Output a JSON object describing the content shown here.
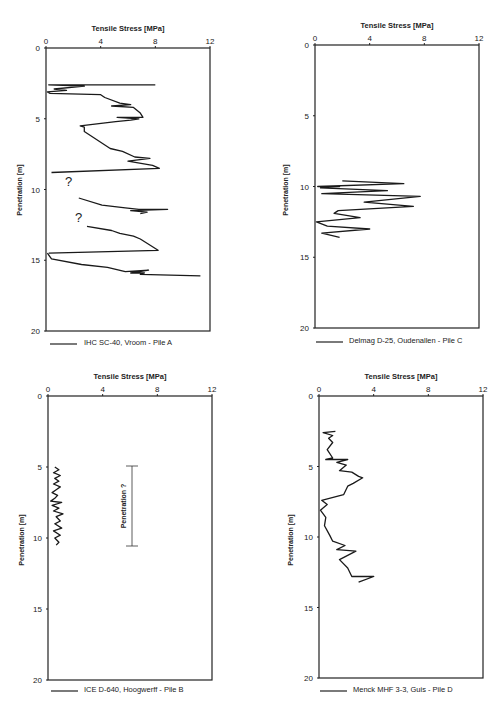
{
  "chart_data": [
    {
      "id": "A",
      "type": "line",
      "title": "",
      "xlabel": "Tensile Stress [MPa]",
      "ylabel": "Penetration [m]",
      "xlim": [
        0,
        12
      ],
      "ylim": [
        0,
        20
      ],
      "y_inverted": true,
      "x_ticks": [
        0,
        4,
        8,
        12
      ],
      "y_ticks": [
        0,
        5,
        10,
        15,
        20
      ],
      "legend": "IHC SC-40, Vroom - Pile A",
      "legend_position": "bottom-left",
      "grid": false,
      "annotations": [
        {
          "text": "?",
          "x": 2.4,
          "depth": 9.6
        },
        {
          "text": "?",
          "x": 2.5,
          "depth": 12.2
        }
      ],
      "series": [
        {
          "name": "Pile A segment 1",
          "points": [
            [
              8.0,
              2.6
            ],
            [
              0.2,
              2.6
            ],
            [
              2.8,
              2.7
            ],
            [
              0.6,
              2.9
            ],
            [
              1.5,
              3.0
            ],
            [
              0.1,
              3.1
            ],
            [
              0.3,
              3.2
            ],
            [
              4.0,
              3.3
            ],
            [
              4.3,
              3.5
            ],
            [
              5.4,
              3.9
            ],
            [
              6.2,
              4.0
            ],
            [
              4.8,
              4.1
            ],
            [
              6.4,
              4.2
            ],
            [
              6.9,
              4.6
            ],
            [
              7.1,
              4.9
            ],
            [
              5.2,
              4.9
            ],
            [
              6.8,
              5.0
            ],
            [
              6.2,
              5.1
            ],
            [
              5.1,
              5.2
            ],
            [
              2.5,
              5.5
            ],
            [
              2.8,
              5.6
            ],
            [
              2.8,
              5.9
            ],
            [
              4.7,
              7.1
            ],
            [
              5.6,
              7.3
            ],
            [
              6.5,
              7.7
            ],
            [
              7.6,
              7.8
            ],
            [
              6.0,
              8.0
            ],
            [
              7.8,
              8.3
            ],
            [
              8.3,
              8.5
            ],
            [
              0.4,
              8.8
            ]
          ]
        },
        {
          "name": "Pile A segment 2",
          "points": [
            [
              2.4,
              10.6
            ],
            [
              4.1,
              11.1
            ],
            [
              5.8,
              11.3
            ],
            [
              6.8,
              11.4
            ],
            [
              8.9,
              11.4
            ],
            [
              6.2,
              11.5
            ],
            [
              7.4,
              11.6
            ],
            [
              6.9,
              11.7
            ]
          ]
        },
        {
          "name": "Pile A segment 3",
          "points": [
            [
              3.0,
              12.6
            ],
            [
              4.8,
              12.9
            ],
            [
              5.4,
              13.1
            ],
            [
              6.4,
              13.3
            ],
            [
              6.9,
              13.5
            ],
            [
              8.2,
              14.3
            ],
            [
              0.2,
              14.5
            ]
          ]
        },
        {
          "name": "Pile A segment 4",
          "points": [
            [
              0.1,
              14.5
            ],
            [
              0.4,
              14.9
            ],
            [
              2.6,
              15.3
            ],
            [
              4.5,
              15.5
            ],
            [
              5.8,
              15.8
            ],
            [
              7.5,
              15.7
            ],
            [
              6.2,
              15.9
            ],
            [
              7.2,
              15.9
            ],
            [
              6.9,
              16.0
            ],
            [
              11.3,
              16.1
            ]
          ]
        }
      ]
    },
    {
      "id": "C",
      "type": "line",
      "title": "",
      "xlabel": "Tensile Stress [MPa]",
      "ylabel": "Penetration [m]",
      "xlim": [
        0,
        12
      ],
      "ylim": [
        0,
        20
      ],
      "y_inverted": true,
      "x_ticks": [
        0,
        4,
        8,
        12
      ],
      "y_ticks": [
        0,
        5,
        10,
        15,
        20
      ],
      "legend": "Delmag D-25, Oudenallen - Pile C",
      "legend_position": "bottom-left",
      "grid": false,
      "series": [
        {
          "name": "Pile C",
          "points": [
            [
              2.0,
              9.6
            ],
            [
              6.5,
              9.8
            ],
            [
              0.2,
              10.0
            ],
            [
              1.8,
              10.0
            ],
            [
              0.4,
              10.1
            ],
            [
              5.3,
              10.3
            ],
            [
              0.5,
              10.5
            ],
            [
              7.7,
              10.7
            ],
            [
              3.6,
              11.1
            ],
            [
              7.2,
              11.4
            ],
            [
              1.7,
              11.7
            ],
            [
              1.4,
              11.9
            ],
            [
              3.3,
              12.2
            ],
            [
              0.1,
              12.5
            ],
            [
              0.9,
              12.8
            ],
            [
              4.0,
              13.0
            ],
            [
              0.5,
              13.3
            ],
            [
              1.8,
              13.6
            ]
          ]
        }
      ]
    },
    {
      "id": "B",
      "type": "line",
      "title": "",
      "xlabel": "Tensile Stress [MPa]",
      "ylabel": "Penetration [m]",
      "xlim": [
        0,
        12
      ],
      "ylim": [
        0,
        20
      ],
      "y_inverted": true,
      "x_ticks": [
        0,
        4,
        8,
        12
      ],
      "y_ticks": [
        0,
        5,
        10,
        15,
        20
      ],
      "legend": "ICE D-640, Hoogwerff - Pile B",
      "legend_position": "bottom-left",
      "grid": false,
      "annotations": [
        {
          "text": "Penetration ?",
          "type": "vertical-range-bar",
          "x": 6.1,
          "depth_from": 5.0,
          "depth_to": 10.5
        }
      ],
      "series": [
        {
          "name": "Pile B",
          "points": [
            [
              0.5,
              5.0
            ],
            [
              0.8,
              5.2
            ],
            [
              0.4,
              5.4
            ],
            [
              0.9,
              5.6
            ],
            [
              0.5,
              5.8
            ],
            [
              0.8,
              6.0
            ],
            [
              0.4,
              6.2
            ],
            [
              0.9,
              6.4
            ],
            [
              0.6,
              6.6
            ],
            [
              0.3,
              6.8
            ],
            [
              0.7,
              7.0
            ],
            [
              0.5,
              7.2
            ],
            [
              0.2,
              7.4
            ],
            [
              1.0,
              7.5
            ],
            [
              0.3,
              7.7
            ],
            [
              0.8,
              7.9
            ],
            [
              0.4,
              8.1
            ],
            [
              1.1,
              8.3
            ],
            [
              0.6,
              8.5
            ],
            [
              0.9,
              8.8
            ],
            [
              0.5,
              9.0
            ],
            [
              1.0,
              9.3
            ],
            [
              0.4,
              9.5
            ],
            [
              0.9,
              9.8
            ],
            [
              0.5,
              10.0
            ],
            [
              0.8,
              10.3
            ],
            [
              0.6,
              10.5
            ]
          ]
        }
      ]
    },
    {
      "id": "D",
      "type": "line",
      "title": "",
      "xlabel": "Tensile Stress [MPa]",
      "ylabel": "Penetration [m]",
      "xlim": [
        0,
        12
      ],
      "ylim": [
        0,
        20
      ],
      "y_inverted": true,
      "x_ticks": [
        0,
        4,
        8,
        12
      ],
      "y_ticks": [
        0,
        5,
        10,
        15,
        20
      ],
      "legend": "Menck MHF 3-3, Guis - Pile D",
      "legend_position": "bottom-left",
      "grid": false,
      "series": [
        {
          "name": "Pile D",
          "points": [
            [
              1.2,
              2.5
            ],
            [
              0.3,
              2.6
            ],
            [
              1.0,
              2.8
            ],
            [
              0.7,
              3.0
            ],
            [
              1.0,
              3.3
            ],
            [
              0.6,
              3.8
            ],
            [
              1.0,
              4.4
            ],
            [
              0.5,
              4.5
            ],
            [
              2.1,
              4.5
            ],
            [
              1.3,
              4.7
            ],
            [
              2.0,
              4.9
            ],
            [
              1.5,
              5.3
            ],
            [
              2.4,
              5.4
            ],
            [
              2.9,
              5.7
            ],
            [
              3.2,
              5.8
            ],
            [
              2.5,
              6.2
            ],
            [
              2.1,
              6.4
            ],
            [
              1.8,
              7.0
            ],
            [
              0.2,
              7.4
            ],
            [
              0.6,
              7.7
            ],
            [
              0.1,
              8.1
            ],
            [
              0.5,
              8.6
            ],
            [
              0.4,
              9.2
            ],
            [
              0.8,
              9.9
            ],
            [
              1.0,
              10.3
            ],
            [
              1.9,
              10.6
            ],
            [
              1.3,
              10.9
            ],
            [
              2.7,
              11.0
            ],
            [
              1.5,
              11.6
            ],
            [
              2.1,
              12.2
            ],
            [
              2.4,
              12.8
            ],
            [
              4.0,
              12.8
            ],
            [
              2.9,
              13.2
            ]
          ]
        }
      ]
    }
  ],
  "labels": {
    "xlabel": "Tensile Stress [MPa]",
    "ylabel": "Penetration [m]",
    "xticks": [
      "0",
      "4",
      "8",
      "12"
    ],
    "yticks": [
      "0",
      "5",
      "10",
      "15",
      "20"
    ],
    "legend_a": "IHC SC-40, Vroom - Pile A",
    "legend_c": "Delmag D-25, Oudenallen - Pile C",
    "legend_b": "ICE D-640, Hoogwerff - Pile B",
    "legend_d": "Menck MHF 3-3, Guis - Pile D",
    "question_mark": "?",
    "penetration_annotation": "Penetration ?"
  },
  "colors": {
    "line": "#1a1a1a",
    "axis": "#222222",
    "background": "#ffffff"
  }
}
